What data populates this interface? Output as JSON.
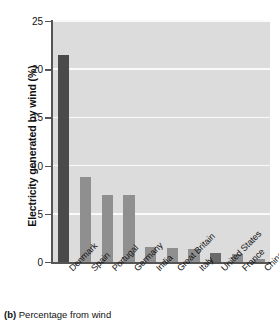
{
  "chart_data": {
    "type": "bar",
    "title": "",
    "subtitle": "",
    "xlabel": "",
    "ylabel": "Electricity generated by wind (%)",
    "ylim": [
      0,
      25
    ],
    "yticks": [
      0,
      5,
      10,
      15,
      20,
      25
    ],
    "ytick_labels": [
      "0",
      "5",
      "10",
      "15",
      "20",
      "25"
    ],
    "grid": true,
    "grid_axis": "y",
    "legend": false,
    "legend_position": "none",
    "categories": [
      "Denmark",
      "Spain",
      "Portugal",
      "Germany",
      "India",
      "Great Britain",
      "Italy",
      "United States",
      "France",
      "China"
    ],
    "values": [
      21.5,
      8.8,
      7.0,
      7.0,
      1.6,
      1.5,
      1.4,
      0.9,
      0.8,
      0.3
    ],
    "bar_colors": [
      "#4a4a4a",
      "#8f8f8f",
      "#8f8f8f",
      "#8f8f8f",
      "#8f8f8f",
      "#8f8f8f",
      "#8f8f8f",
      "#6a6a6a",
      "#8f8f8f",
      "#8f8f8f"
    ],
    "plot_background": "#dcdcdc",
    "gridline_color": "#fafafa",
    "axis_color": "#555555"
  },
  "caption": {
    "tag": "(b)",
    "text": "Percentage from wind"
  }
}
